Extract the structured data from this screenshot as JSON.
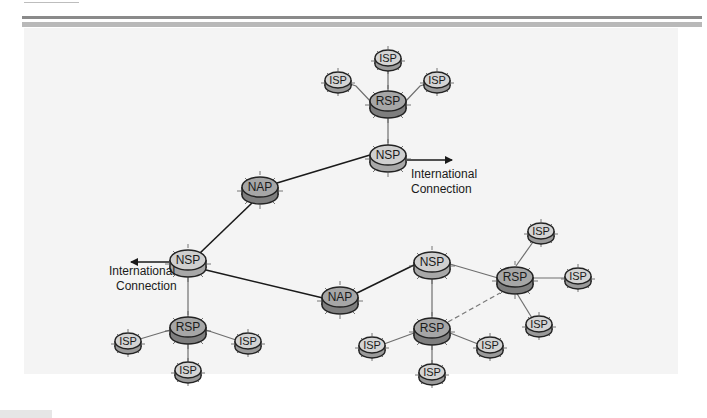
{
  "diagram": {
    "type": "network-topology",
    "colors": {
      "background": "#f4f4f4",
      "rule_dark": "#8a8a8a",
      "rule_light": "#b9b9b9",
      "light_node_top": "#d2d2d2",
      "dark_node_top": "#a4a4a4",
      "link": "#1a1a1a",
      "thin_link": "#7a7a7a"
    },
    "nodes": [
      {
        "id": "isp-top-n",
        "label": "ISP",
        "kind": "ISP"
      },
      {
        "id": "isp-top-w",
        "label": "ISP",
        "kind": "ISP"
      },
      {
        "id": "isp-top-e",
        "label": "ISP",
        "kind": "ISP"
      },
      {
        "id": "rsp-top",
        "label": "RSP",
        "kind": "RSP"
      },
      {
        "id": "nsp-top",
        "label": "NSP",
        "kind": "NSP"
      },
      {
        "id": "nap-upper",
        "label": "NAP",
        "kind": "NAP"
      },
      {
        "id": "nsp-left",
        "label": "NSP",
        "kind": "NSP"
      },
      {
        "id": "rsp-left",
        "label": "RSP",
        "kind": "RSP"
      },
      {
        "id": "isp-left-w",
        "label": "ISP",
        "kind": "ISP"
      },
      {
        "id": "isp-left-e",
        "label": "ISP",
        "kind": "ISP"
      },
      {
        "id": "isp-left-s",
        "label": "ISP",
        "kind": "ISP"
      },
      {
        "id": "nap-lower",
        "label": "NAP",
        "kind": "NAP"
      },
      {
        "id": "nsp-right",
        "label": "NSP",
        "kind": "NSP"
      },
      {
        "id": "rsp-right",
        "label": "RSP",
        "kind": "RSP"
      },
      {
        "id": "isp-right-n",
        "label": "ISP",
        "kind": "ISP"
      },
      {
        "id": "isp-right-e",
        "label": "ISP",
        "kind": "ISP"
      },
      {
        "id": "isp-right-s",
        "label": "ISP",
        "kind": "ISP"
      },
      {
        "id": "rsp-mid",
        "label": "RSP",
        "kind": "RSP"
      },
      {
        "id": "isp-mid-w",
        "label": "ISP",
        "kind": "ISP"
      },
      {
        "id": "isp-mid-e",
        "label": "ISP",
        "kind": "ISP"
      },
      {
        "id": "isp-mid-s",
        "label": "ISP",
        "kind": "ISP"
      }
    ],
    "edges": [
      {
        "from": "isp-top-n",
        "to": "rsp-top",
        "style": "thin"
      },
      {
        "from": "isp-top-w",
        "to": "rsp-top",
        "style": "thin"
      },
      {
        "from": "isp-top-e",
        "to": "rsp-top",
        "style": "thin"
      },
      {
        "from": "rsp-top",
        "to": "nsp-top",
        "style": "thin"
      },
      {
        "from": "nsp-top",
        "to": "nap-upper",
        "style": "thick"
      },
      {
        "from": "nap-upper",
        "to": "nsp-left",
        "style": "thick"
      },
      {
        "from": "nsp-left",
        "to": "nap-lower",
        "style": "thick"
      },
      {
        "from": "nsp-left",
        "to": "rsp-left",
        "style": "thin"
      },
      {
        "from": "rsp-left",
        "to": "isp-left-w",
        "style": "thin"
      },
      {
        "from": "rsp-left",
        "to": "isp-left-e",
        "style": "thin"
      },
      {
        "from": "rsp-left",
        "to": "isp-left-s",
        "style": "thin"
      },
      {
        "from": "nap-lower",
        "to": "nsp-right",
        "style": "thick"
      },
      {
        "from": "nsp-right",
        "to": "rsp-right",
        "style": "thin"
      },
      {
        "from": "nsp-right",
        "to": "rsp-mid",
        "style": "thin"
      },
      {
        "from": "rsp-mid",
        "to": "rsp-right",
        "style": "dashed"
      },
      {
        "from": "rsp-right",
        "to": "isp-right-n",
        "style": "thin"
      },
      {
        "from": "rsp-right",
        "to": "isp-right-e",
        "style": "thin"
      },
      {
        "from": "rsp-right",
        "to": "isp-right-s",
        "style": "thin"
      },
      {
        "from": "rsp-mid",
        "to": "isp-mid-w",
        "style": "thin"
      },
      {
        "from": "rsp-mid",
        "to": "isp-mid-e",
        "style": "thin"
      },
      {
        "from": "rsp-mid",
        "to": "isp-mid-s",
        "style": "thin"
      }
    ],
    "external_links": [
      {
        "from": "nsp-top",
        "direction": "right",
        "label_line1": "International",
        "label_line2": "Connection"
      },
      {
        "from": "nsp-left",
        "direction": "left",
        "label_line1": "International",
        "label_line2": "Connection"
      }
    ]
  }
}
